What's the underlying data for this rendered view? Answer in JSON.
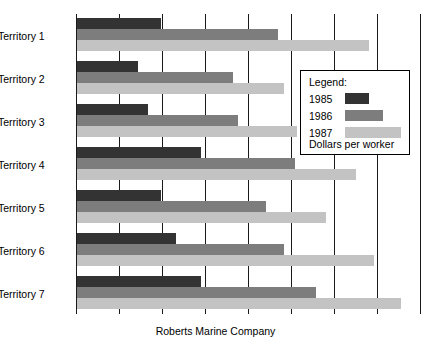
{
  "chart_data": {
    "type": "bar",
    "orientation": "horizontal",
    "title": "",
    "caption": "Roberts Marine Company",
    "xlabel": "",
    "ylabel": "",
    "grid": true,
    "gridlines_count": 8,
    "legend": {
      "title": "Legend:",
      "footer": "Dollars per worker",
      "position": "inside-right",
      "entries": [
        {
          "label": "1985",
          "color": "#333333"
        },
        {
          "label": "1986",
          "color": "#7d7d7d"
        },
        {
          "label": "1987",
          "color": "#c3c3c3"
        }
      ]
    },
    "categories": [
      "Territory 1",
      "Territory 2",
      "Territory 3",
      "Territory 4",
      "Territory 5",
      "Territory 6",
      "Territory 7"
    ],
    "series": [
      {
        "name": "1985",
        "color": "#333333",
        "values": [
          84,
          61,
          71,
          124,
          84,
          99,
          124
        ]
      },
      {
        "name": "1986",
        "color": "#7d7d7d",
        "values": [
          201,
          156,
          161,
          218,
          189,
          207,
          239
        ]
      },
      {
        "name": "1987",
        "color": "#c3c3c3",
        "values": [
          292,
          207,
          220,
          279,
          249,
          297,
          324
        ]
      }
    ],
    "xlim": [
      0,
      345
    ],
    "axis_origin_px": 76,
    "gridline_spacing_px": 43
  },
  "chart": {
    "bar_height_px": 11,
    "group_pitch_px": 43,
    "group_top_offset_px": 4
  }
}
